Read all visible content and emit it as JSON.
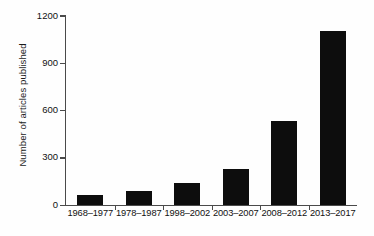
{
  "chart_data": {
    "type": "bar",
    "title": "",
    "xlabel": "",
    "ylabel": "Number of articles published",
    "categories": [
      "1968–1977",
      "1978–1987",
      "1998–2002",
      "2003–2007",
      "2008–2012",
      "2013–2017"
    ],
    "values": [
      62,
      88,
      140,
      228,
      533,
      1105
    ],
    "ylim": [
      0,
      1200
    ],
    "yticks": [
      "0",
      "300",
      "600",
      "900",
      "1200"
    ],
    "ytick_values": [
      0,
      300,
      600,
      900,
      1200
    ],
    "grid": false,
    "legend": null,
    "bar_color": "#0d0d0d",
    "axis_color": "#4a4a4a",
    "background_color": "#ffffff"
  }
}
